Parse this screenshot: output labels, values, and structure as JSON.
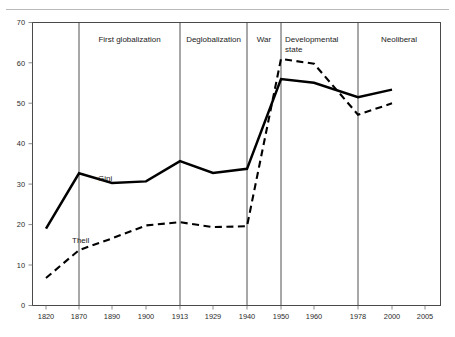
{
  "chart_data": {
    "type": "line",
    "title": "",
    "subtitle": "",
    "xlabel": "",
    "ylabel": "",
    "xlim": [
      1820,
      2005
    ],
    "ylim": [
      0,
      70
    ],
    "yticks": [
      0,
      10,
      20,
      30,
      40,
      50,
      60,
      70
    ],
    "xticks": [
      1820,
      1870,
      1890,
      1900,
      1913,
      1929,
      1940,
      1950,
      1960,
      1978,
      2000,
      2005
    ],
    "xtick_labels": [
      "1820",
      "1870",
      "1890",
      "1900",
      "1913",
      "1929",
      "1940",
      "1950",
      "1960",
      "1978",
      "2000",
      "2005"
    ],
    "ytick_labels": [
      "0",
      "10",
      "20",
      "30",
      "40",
      "50",
      "60",
      "70"
    ],
    "grid": false,
    "legend_position": "inline-annotation",
    "x": [
      1820,
      1870,
      1890,
      1900,
      1913,
      1929,
      1940,
      1950,
      1960,
      1978,
      2000
    ],
    "series": [
      {
        "name": "Gini",
        "style": "solid",
        "color": "#000000",
        "values": [
          19.0,
          32.7,
          30.3,
          30.7,
          35.7,
          32.8,
          33.8,
          56.0,
          55.1,
          51.5,
          53.4
        ]
      },
      {
        "name": "Theil",
        "style": "dashed",
        "color": "#000000",
        "values": [
          6.8,
          13.7,
          16.6,
          19.8,
          20.6,
          19.4,
          19.6,
          61.0,
          59.8,
          47.2,
          50.0
        ]
      }
    ],
    "annotations": [
      {
        "name": "gini-label",
        "text": "Gini",
        "x": 1890,
        "y": 34.5
      },
      {
        "name": "theil-label",
        "text": "Theil",
        "x": 1876,
        "y": 17.0
      }
    ],
    "period_dividers": [
      1870,
      1913,
      1940,
      1950,
      1978
    ],
    "periods": [
      {
        "name": "first-globalization",
        "label": "First globalization",
        "start": 1870,
        "end": 1913,
        "align": "center"
      },
      {
        "name": "deglobalization",
        "label": "Deglobalization",
        "start": 1913,
        "end": 1940,
        "align": "center"
      },
      {
        "name": "war",
        "label": "War",
        "start": 1940,
        "end": 1950,
        "align": "center"
      },
      {
        "name": "developmental-state",
        "label": "Developmental state",
        "start": 1950,
        "end": 1978,
        "align": "left"
      },
      {
        "name": "neoliberal",
        "label": "Neoliberal",
        "start": 1978,
        "end": 2005,
        "align": "center"
      }
    ]
  }
}
